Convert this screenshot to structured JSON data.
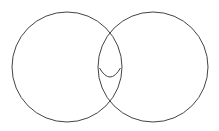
{
  "diagram": {
    "type": "venn",
    "background": "#ffffff",
    "stroke": "#444444",
    "circles": [
      {
        "name": "left-circle",
        "cx": 67,
        "cy": 67,
        "r": 55
      },
      {
        "name": "right-circle",
        "cx": 153,
        "cy": 67,
        "r": 55
      }
    ],
    "inner_arc": {
      "start": [
        99.5,
        68
      ],
      "control": [
        110,
        86
      ],
      "end": [
        120.5,
        68
      ]
    }
  }
}
